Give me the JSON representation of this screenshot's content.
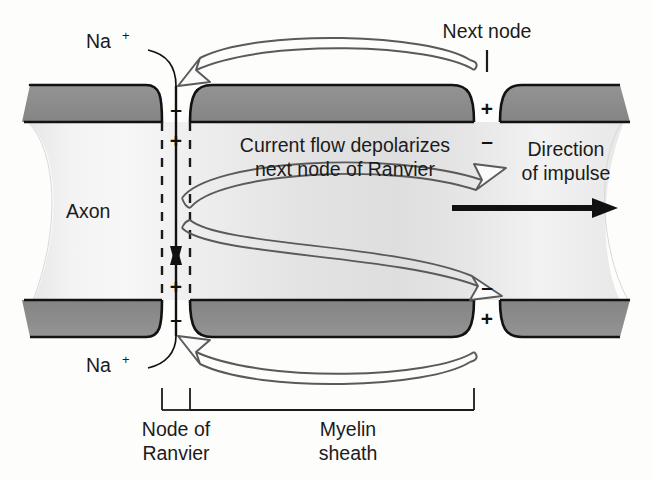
{
  "figure": {
    "background_color": "#fdfdfc"
  },
  "palette": {
    "myelin_fill": "#8c8c8c",
    "myelin_stroke": "#121212",
    "axon_light": "#efefef",
    "axon_mid": "#e2e2e2",
    "axon_shade": "#d6d6d6",
    "outline_arrow_stroke": "#5a5a5a",
    "outline_arrow_fill": "#fafafa",
    "solid_arrow": "#111111",
    "text": "#1b1b1b",
    "dash_line": "#1b1b1b"
  },
  "labels": {
    "na_top": {
      "text": "Na",
      "superscript": "+"
    },
    "na_bottom": {
      "text": "Na",
      "superscript": "+"
    },
    "axon": "Axon",
    "next_node": "Next node",
    "current_flow_line1": "Current flow depolarizes",
    "current_flow_line2": "next node of Ranvier",
    "direction_line1": "Direction",
    "direction_line2": "of impulse",
    "node_of_ranvier_line1": "Node of",
    "node_of_ranvier_line2": "Ranvier",
    "myelin_sheath_line1": "Myelin",
    "myelin_sheath_line2": "sheath"
  },
  "charges": {
    "active_node_outside": "–",
    "active_node_inside": "+",
    "next_node_outside": "+",
    "next_node_inside": "–",
    "active_node_outside_bottom": "–",
    "active_node_inside_bottom": "+",
    "next_node_outside_bottom": "+",
    "next_node_inside_bottom": "–"
  },
  "annotations": {
    "impulse_direction": "left-to-right",
    "na_influx": "sodium ions enter at the node of Ranvier",
    "current_arrows": "local current spreads from active node to next node"
  }
}
